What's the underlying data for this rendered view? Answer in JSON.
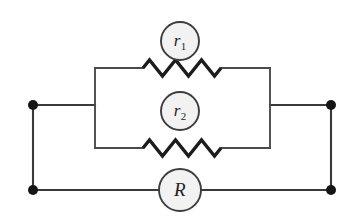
{
  "diagram": {
    "type": "electrical-circuit-schematic",
    "background_color": "#ffffff",
    "wire_color": "#3a3a3a",
    "node_color": "#151515",
    "component_fill": "#f2f2f2",
    "component_stroke": "#3d3d3d"
  },
  "components": {
    "resistor_top": {
      "label_base": "r",
      "label_sub": "1",
      "symbol": "zigzag-resistor",
      "branch": "upper-parallel-branch"
    },
    "resistor_middle": {
      "label_base": "r",
      "label_sub": "2",
      "symbol": "zigzag-resistor",
      "branch": "lower-parallel-branch"
    },
    "resistor_bottom": {
      "label_base": "R",
      "label_sub": "",
      "symbol": "circle-resistor",
      "branch": "outer-series-branch"
    }
  },
  "nodes": [
    {
      "name": "terminal-top-left",
      "x": 33,
      "y": 105
    },
    {
      "name": "terminal-bottom-left",
      "x": 33,
      "y": 190
    },
    {
      "name": "terminal-top-right",
      "x": 331,
      "y": 105
    },
    {
      "name": "terminal-bottom-right",
      "x": 331,
      "y": 190
    }
  ],
  "geometry": {
    "inner_loop_left_x": 95,
    "inner_loop_right_x": 270,
    "inner_branch_top_y": 68,
    "inner_branch_bottom_y": 148,
    "mid_rail_y": 105,
    "bottom_rail_y": 190,
    "zigzag_start_x": 143,
    "zigzag_end_x": 221,
    "zigzag_peaks": 6,
    "zigzag_amplitude": 8,
    "circle_radius_small": 19,
    "circle_radius_large": 21
  }
}
